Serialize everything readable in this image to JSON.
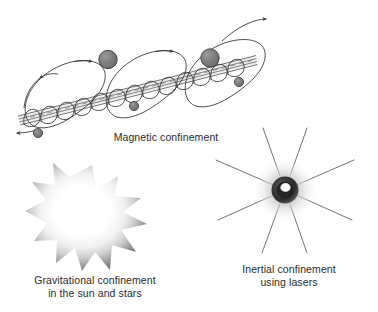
{
  "figure": {
    "width": 378,
    "height": 312,
    "background": "#ffffff"
  },
  "panels": {
    "magnetic": {
      "name": "magnetic-confinement",
      "caption_line1": "Magnetic confinement",
      "description": "Charged particles spiralling in helical orbits along straight magnetic field lines, with larger looping drift orbits above and below the field line bundle",
      "elements": {
        "field_line_count": 4,
        "helix_turns": 13,
        "large_particles": 3,
        "small_particles": 3,
        "drift_loops": 3,
        "arrow_heads": 4
      },
      "colors": {
        "line": "#3a3a3a",
        "particle_large": "#7d7d7d",
        "particle_small": "#8a8a8a",
        "particle_outline": "#3a3a3a",
        "field_band": "#e8e8e8"
      }
    },
    "gravitational": {
      "name": "gravitational-confinement",
      "caption_line1": "Gravitational confinement",
      "caption_line2": "in the sun and stars",
      "description": "A jagged star burst shape with a bright white core fading through grey at the spiked rim",
      "elements": {
        "spike_count": 11
      },
      "colors": {
        "core": "#ffffff",
        "mid": "#d9d9d9",
        "rim": "#7f7f7f"
      }
    },
    "inertial": {
      "name": "inertial-confinement",
      "caption_line1": "Inertial confinement",
      "caption_line2": "using lasers",
      "description": "A small dark fuel pellet with a bright hot spot, surrounded by a diffuse grey corona, targeted by eight converging laser beams",
      "elements": {
        "laser_beam_count": 8,
        "pellet_radius_px": 13,
        "corona_radius_px": 31
      },
      "colors": {
        "beam": "#555555",
        "pellet_dark": "#2e2e2e",
        "pellet_hot": "#ffffff",
        "corona": "#cfcfcf"
      }
    }
  }
}
